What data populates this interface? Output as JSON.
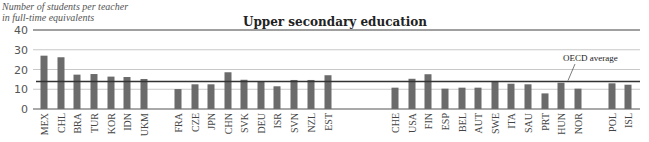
{
  "chart_data": {
    "type": "bar",
    "title": "Upper secondary education",
    "ylabel": "Number of students per teacher in full-time equivalents",
    "xlabel": "",
    "ylim": [
      0,
      40
    ],
    "yticks": [
      0,
      10,
      20,
      30,
      40
    ],
    "grid": true,
    "legend": null,
    "groups": [
      [
        "MEX",
        "CHL",
        "BRA",
        "TUR",
        "KOR",
        "IDN",
        "UKM"
      ],
      [
        "FRA",
        "CZE",
        "JPN",
        "CHN",
        "SVK",
        "DEU",
        "ISR",
        "SVN",
        "NZL",
        "EST"
      ],
      [
        "CHE",
        "USA",
        "FIN",
        "ESP",
        "BEL",
        "AUT",
        "SWE",
        "ITA",
        "SAU",
        "PRT",
        "HUN",
        "NOR"
      ],
      [
        "POL",
        "ISL"
      ]
    ],
    "categories": [
      "MEX",
      "CHL",
      "BRA",
      "TUR",
      "KOR",
      "IDN",
      "UKM",
      "FRA",
      "CZE",
      "JPN",
      "CHN",
      "SVK",
      "DEU",
      "ISR",
      "SVN",
      "NZL",
      "EST",
      "CHE",
      "USA",
      "FIN",
      "ESP",
      "BEL",
      "AUT",
      "SWE",
      "ITA",
      "SAU",
      "PRT",
      "HUN",
      "NOR",
      "POL",
      "ISL"
    ],
    "values": [
      27.0,
      26.2,
      17.4,
      17.7,
      16.4,
      16.2,
      15.2,
      10.1,
      12.5,
      12.5,
      18.6,
      14.8,
      14.0,
      11.5,
      14.7,
      14.7,
      17.1,
      10.8,
      15.3,
      17.6,
      10.3,
      10.8,
      10.8,
      14.2,
      12.8,
      12.5,
      7.9,
      13.3,
      10.3,
      13.0,
      12.3
    ],
    "x_positions": [
      44,
      61,
      77,
      94,
      111,
      127,
      144,
      178,
      195,
      211,
      228,
      244,
      261,
      277,
      294,
      311,
      328,
      395,
      412,
      428,
      445,
      462,
      478,
      495,
      511,
      528,
      545,
      561,
      578,
      612,
      628
    ],
    "reference_line": {
      "label": "OECD average",
      "value": 13.9
    },
    "colors": {
      "bar": "#6b6b6b",
      "grid": "#c8c8c8",
      "reference": "#333333",
      "axis": "#555555"
    }
  },
  "ylabel_line1": "Number of students per teacher",
  "ylabel_line2": "in full-time equivalents",
  "title": "Upper secondary education",
  "annotation": "OECD average"
}
